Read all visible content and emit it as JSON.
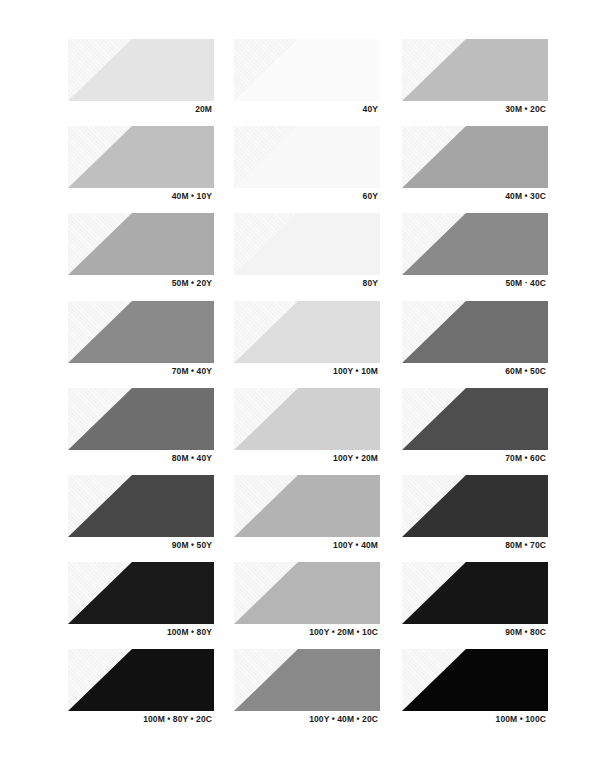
{
  "swatches": [
    {
      "label": "20M",
      "color": "#e4e4e4"
    },
    {
      "label": "40Y",
      "color": "#fbfbfb"
    },
    {
      "label": "30M • 20C",
      "color": "#bdbdbd"
    },
    {
      "label": "40M • 10Y",
      "color": "#bfbfbf"
    },
    {
      "label": "60Y",
      "color": "#f8f8f8"
    },
    {
      "label": "40M • 30C",
      "color": "#a5a5a5"
    },
    {
      "label": "50M • 20Y",
      "color": "#ababab"
    },
    {
      "label": "80Y",
      "color": "#f3f3f3"
    },
    {
      "label": "50M · 40C",
      "color": "#8a8a8a"
    },
    {
      "label": "70M • 40Y",
      "color": "#8a8a8a"
    },
    {
      "label": "100Y • 10M",
      "color": "#dddddd"
    },
    {
      "label": "60M • 50C",
      "color": "#6f6f6f"
    },
    {
      "label": "80M • 40Y",
      "color": "#6e6e6e"
    },
    {
      "label": "100Y • 20M",
      "color": "#d0d0d0"
    },
    {
      "label": "70M • 60C",
      "color": "#4e4e4e"
    },
    {
      "label": "90M • 50Y",
      "color": "#474747"
    },
    {
      "label": "100Y • 40M",
      "color": "#b3b3b3"
    },
    {
      "label": "80M • 70C",
      "color": "#323232"
    },
    {
      "label": "100M • 80Y",
      "color": "#1a1a1a"
    },
    {
      "label": "100Y • 20M • 10C",
      "color": "#b5b5b5"
    },
    {
      "label": "90M • 80C",
      "color": "#151515"
    },
    {
      "label": "100M • 80Y • 20C",
      "color": "#111111"
    },
    {
      "label": "100Y • 40M • 20C",
      "color": "#898989"
    },
    {
      "label": "100M • 100C",
      "color": "#050505"
    }
  ]
}
